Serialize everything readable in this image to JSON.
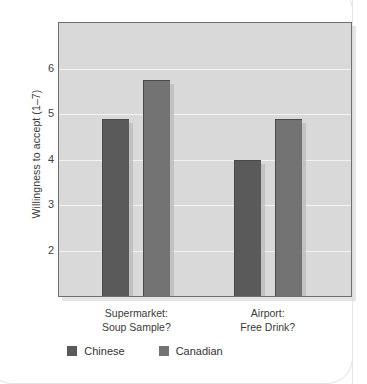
{
  "chart_data": {
    "type": "bar",
    "title": "",
    "subtitle": "",
    "xlabel": "",
    "ylabel": "Willingness to accept (1–7)",
    "categories": [
      "Supermarket:\nSoup Sample?",
      "Airport:\nFree Drink?"
    ],
    "category_lines": [
      [
        "Supermarket:",
        "Soup Sample?"
      ],
      [
        "Airport:",
        "Free Drink?"
      ]
    ],
    "series": [
      {
        "name": "Chinese",
        "color": "#5a5a5a",
        "values": [
          4.9,
          4.0
        ]
      },
      {
        "name": "Canadian",
        "color": "#737373",
        "values": [
          5.75,
          4.9
        ]
      }
    ],
    "ylim": [
      1,
      7
    ],
    "yticks": [
      2,
      3,
      4,
      5,
      6
    ],
    "ytick_labels": [
      "2",
      "3",
      "4",
      "5",
      "6"
    ],
    "gridlines": [
      2,
      3,
      4,
      5,
      6
    ],
    "grid": true,
    "grid_color": "#f2f2f2",
    "legend_position": "bottom",
    "panel_background": "#d9d9d9",
    "panel_border_color": "#6f6f6f"
  },
  "legend": {
    "items": [
      {
        "label": "Chinese",
        "color": "#5a5a5a"
      },
      {
        "label": "Canadian",
        "color": "#737373"
      }
    ]
  }
}
